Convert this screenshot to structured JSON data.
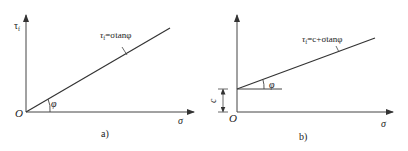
{
  "figure": {
    "panels": [
      {
        "id": "a",
        "caption": "a)",
        "y_axis_label": "τ",
        "y_axis_label_sub": "f",
        "x_axis_label": "σ",
        "origin_label": "O",
        "angle_label": "φ",
        "line_equation_lhs": "τ",
        "line_equation_sub": "f",
        "line_equation_rhs": "=σtanφ"
      },
      {
        "id": "b",
        "caption": "b)",
        "x_axis_label": "σ",
        "origin_label": "O",
        "angle_label": "φ",
        "intercept_label": "c",
        "line_equation_lhs": "τ",
        "line_equation_sub": "f",
        "line_equation_rhs": "=c+σtanφ"
      }
    ],
    "colors": {
      "line": "#333333",
      "background": "#ffffff"
    }
  }
}
